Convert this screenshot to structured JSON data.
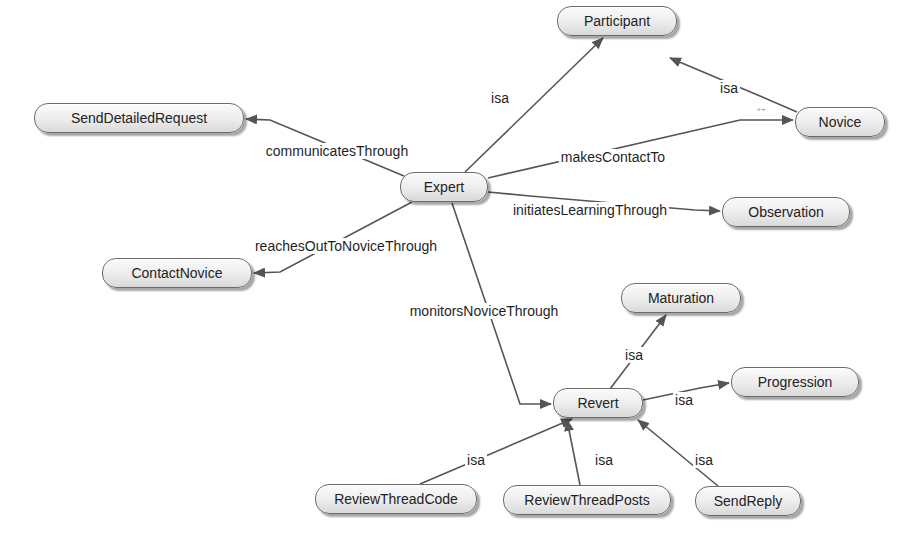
{
  "diagram": {
    "nodes": [
      {
        "id": "expert",
        "label": "Expert",
        "x": 400,
        "y": 172,
        "w": 88
      },
      {
        "id": "participant",
        "label": "Participant",
        "x": 557,
        "y": 6,
        "w": 120
      },
      {
        "id": "novice",
        "label": "Novice",
        "x": 795,
        "y": 107,
        "w": 90
      },
      {
        "id": "senddetailedrequest",
        "label": "SendDetailedRequest",
        "x": 34,
        "y": 103,
        "w": 210
      },
      {
        "id": "observation",
        "label": "Observation",
        "x": 722,
        "y": 197,
        "w": 128
      },
      {
        "id": "contactnovice",
        "label": "ContactNovice",
        "x": 102,
        "y": 258,
        "w": 150
      },
      {
        "id": "maturation",
        "label": "Maturation",
        "x": 621,
        "y": 283,
        "w": 120
      },
      {
        "id": "progression",
        "label": "Progression",
        "x": 731,
        "y": 367,
        "w": 128
      },
      {
        "id": "revert",
        "label": "Revert",
        "x": 553,
        "y": 388,
        "w": 90
      },
      {
        "id": "reviewthreadcode",
        "label": "ReviewThreadCode",
        "x": 315,
        "y": 484,
        "w": 162
      },
      {
        "id": "reviewthreadposts",
        "label": "ReviewThreadPosts",
        "x": 503,
        "y": 485,
        "w": 168
      },
      {
        "id": "sendreply",
        "label": "SendReply",
        "x": 695,
        "y": 486,
        "w": 106
      }
    ],
    "edges": [
      {
        "from": "expert",
        "to": "participant",
        "label": "isa",
        "label_x": 500,
        "label_y": 98
      },
      {
        "from": "novice",
        "to": "participant",
        "label": "isa",
        "label_x": 729,
        "label_y": 88
      },
      {
        "from": "expert",
        "to": "novice",
        "label": "makesContactTo",
        "label_x": 613,
        "label_y": 157
      },
      {
        "from": "expert",
        "to": "senddetailedrequest",
        "label": "communicatesThrough",
        "label_x": 337,
        "label_y": 151
      },
      {
        "from": "expert",
        "to": "observation",
        "label": "initiatesLearningThrough",
        "label_x": 590,
        "label_y": 210
      },
      {
        "from": "expert",
        "to": "contactnovice",
        "label": "reachesOutToNoviceThrough",
        "label_x": 346,
        "label_y": 246
      },
      {
        "from": "expert",
        "to": "revert",
        "label": "monitorsNoviceThrough",
        "label_x": 484,
        "label_y": 311
      },
      {
        "from": "revert",
        "to": "maturation",
        "label": "isa",
        "label_x": 634,
        "label_y": 355
      },
      {
        "from": "revert",
        "to": "progression",
        "label": "isa",
        "label_x": 684,
        "label_y": 400
      },
      {
        "from": "reviewthreadcode",
        "to": "revert",
        "label": "isa",
        "label_x": 476,
        "label_y": 460
      },
      {
        "from": "reviewthreadposts",
        "to": "revert",
        "label": "isa",
        "label_x": 604,
        "label_y": 460
      },
      {
        "from": "sendreply",
        "to": "revert",
        "label": "isa",
        "label_x": 704,
        "label_y": 460
      }
    ],
    "decorations": [
      {
        "name": "double-arrow-icon",
        "glyph": "↔",
        "x": 761,
        "y": 107
      }
    ]
  }
}
